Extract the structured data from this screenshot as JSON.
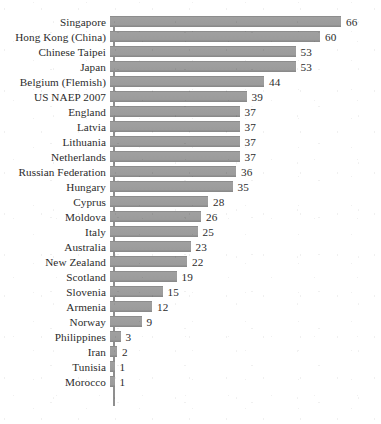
{
  "chart_data": {
    "type": "bar",
    "orientation": "horizontal",
    "title": "",
    "subtitle": "",
    "xlabel": "",
    "ylabel": "",
    "xlim": [
      0,
      70
    ],
    "grid": false,
    "legend": null,
    "bar_color": "#9a9a9a",
    "axis_color": "#8f8f8f",
    "text_color": "#2b2b2b",
    "background": "#ffffff",
    "show_value_labels": true,
    "categories": [
      "Singapore",
      "Hong Kong (China)",
      "Chinese Taipei",
      "Japan",
      "Belgium (Flemish)",
      "US NAEP 2007",
      "England",
      "Latvia",
      "Lithuania",
      "Netherlands",
      "Russian Federation",
      "Hungary",
      "Cyprus",
      "Moldova",
      "Italy",
      "Australia",
      "New Zealand",
      "Scotland",
      "Slovenia",
      "Armenia",
      "Norway",
      "Philippines",
      "Iran",
      "Tunisia",
      "Morocco"
    ],
    "values": [
      66,
      60,
      53,
      53,
      44,
      39,
      37,
      37,
      37,
      37,
      36,
      35,
      28,
      26,
      25,
      23,
      22,
      19,
      15,
      12,
      9,
      3,
      2,
      1,
      1
    ],
    "value_labels": [
      "66",
      "60",
      "53",
      "53",
      "44",
      "39",
      "37",
      "37",
      "37",
      "37",
      "36",
      "35",
      "28",
      "26",
      "25",
      "23",
      "22",
      "19",
      "15",
      "12",
      "9",
      "3",
      "2",
      "1",
      "1"
    ]
  }
}
